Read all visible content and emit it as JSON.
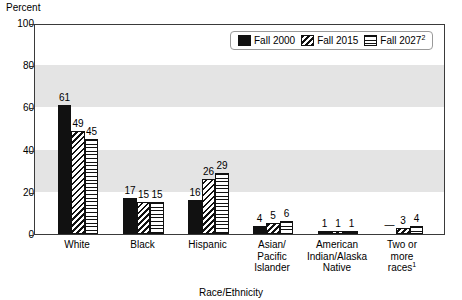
{
  "chart_data": {
    "type": "bar",
    "title": "",
    "ylabel": "Percent",
    "xlabel": "Race/Ethnicity",
    "ylim": [
      0,
      100
    ],
    "ytick_values": [
      0,
      20,
      40,
      60,
      80,
      100
    ],
    "ytick_labels": [
      "0",
      "20",
      "40",
      "60",
      "80",
      "100"
    ],
    "grid": false,
    "banded_background": true,
    "band_color": "#e4e4e4",
    "legend_position": "top-right",
    "categories": [
      "White",
      "Black",
      "Hispanic",
      "Asian/ Pacific Islander",
      "American Indian/Alaska Native",
      "Two or more races"
    ],
    "series": [
      {
        "name": "Fall 2000",
        "fill": "solid-black",
        "values": [
          61,
          17,
          16,
          4,
          1,
          null
        ],
        "labels": [
          "61",
          "17",
          "16",
          "4",
          "1",
          "—"
        ]
      },
      {
        "name": "Fall 2015",
        "fill": "diagonal-hatch",
        "values": [
          49,
          15,
          26,
          5,
          1,
          3
        ],
        "labels": [
          "49",
          "15",
          "26",
          "5",
          "1",
          "3"
        ]
      },
      {
        "name": "Fall 2027",
        "fill": "horizontal-lines",
        "values": [
          45,
          15,
          29,
          6,
          1,
          4
        ],
        "labels": [
          "45",
          "15",
          "29",
          "6",
          "1",
          "4"
        ]
      }
    ]
  },
  "axis": {
    "y_title": "Percent",
    "x_title": "Race/Ethnicity"
  },
  "legend": {
    "items": [
      {
        "label": "Fall 2000",
        "sup": ""
      },
      {
        "label": "Fall 2015",
        "sup": ""
      },
      {
        "label": "Fall 2027",
        "sup": "2"
      }
    ]
  },
  "x_categories": [
    {
      "lines": [
        "White"
      ],
      "sup": ""
    },
    {
      "lines": [
        "Black"
      ],
      "sup": ""
    },
    {
      "lines": [
        "Hispanic"
      ],
      "sup": ""
    },
    {
      "lines": [
        "Asian/",
        "Pacific",
        "Islander"
      ],
      "sup": ""
    },
    {
      "lines": [
        "American",
        "Indian/Alaska",
        "Native"
      ],
      "sup": ""
    },
    {
      "lines": [
        "Two or",
        "more",
        "races"
      ],
      "sup": "1"
    }
  ]
}
